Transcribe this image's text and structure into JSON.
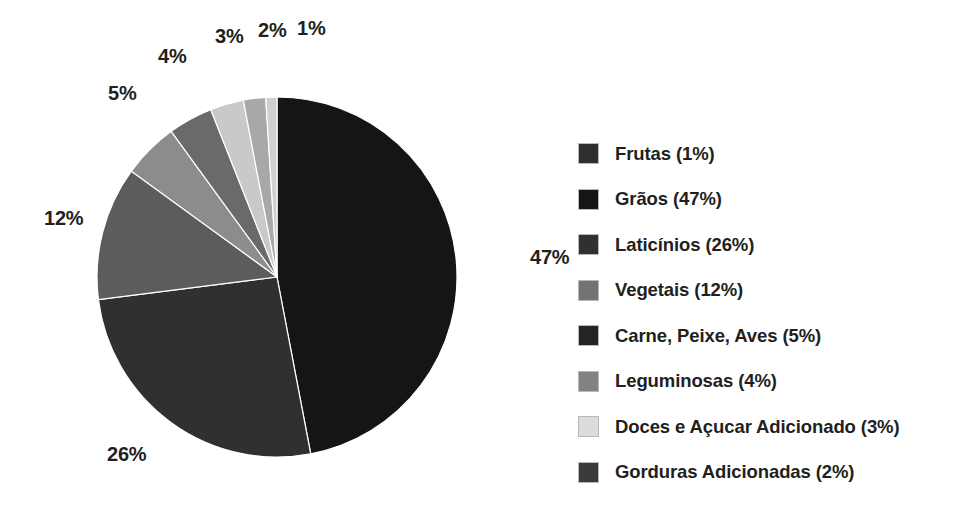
{
  "chart_data": {
    "type": "pie",
    "title": "",
    "subtitle": "",
    "xlabel": "",
    "ylabel": "",
    "units": "percent",
    "legend_position": "right",
    "grid": false,
    "start_angle_deg": 0,
    "direction": "clockwise",
    "categories": [
      "Frutas",
      "Grãos",
      "Laticínios",
      "Vegetais",
      "Carne, Peixe, Aves",
      "Leguminosas",
      "Doces e Açucar Adicionado",
      "Gorduras Adicionadas"
    ],
    "values": [
      1,
      47,
      26,
      12,
      5,
      4,
      3,
      2
    ],
    "colors": [
      "#2f2f2f",
      "#151515",
      "#303030",
      "#737373",
      "#242424",
      "#828282",
      "#dcdcdc",
      "#3a3a3a"
    ],
    "slice_order_clockwise_from_top": [
      "Grãos",
      "Laticínios",
      "Vegetais",
      "Carne, Peixe, Aves",
      "Leguminosas",
      "Doces e Açucar Adicionado",
      "Gorduras Adicionadas",
      "Frutas"
    ]
  },
  "pie": {
    "geometry": {
      "cx": 277,
      "cy": 277,
      "r": 180
    },
    "slices": [
      {
        "name": "graos",
        "label": "Grãos",
        "percent": 47,
        "color": "#151515",
        "start_deg": 0,
        "sweep_deg": 169.2
      },
      {
        "name": "laticinios",
        "label": "Laticínios",
        "percent": 26,
        "color": "#303030",
        "start_deg": 169.2,
        "sweep_deg": 93.6
      },
      {
        "name": "vegetais",
        "label": "Vegetais",
        "percent": 12,
        "color": "#5c5c5c",
        "start_deg": 262.8,
        "sweep_deg": 43.2
      },
      {
        "name": "carne-peixe-aves",
        "label": "Carne, Peixe, Aves",
        "percent": 5,
        "color": "#8c8c8c",
        "start_deg": 306.0,
        "sweep_deg": 18.0
      },
      {
        "name": "leguminosas",
        "label": "Leguminosas",
        "percent": 4,
        "color": "#6a6a6a",
        "start_deg": 324.0,
        "sweep_deg": 14.4
      },
      {
        "name": "doces-acucar-adicionado",
        "label": "Doces e Açucar Adicionado",
        "percent": 3,
        "color": "#c9c9c9",
        "start_deg": 338.4,
        "sweep_deg": 10.8
      },
      {
        "name": "gorduras-adicionadas",
        "label": "Gorduras Adicionadas",
        "percent": 2,
        "color": "#a8a8a8",
        "start_deg": 349.2,
        "sweep_deg": 7.2
      },
      {
        "name": "frutas",
        "label": "Frutas",
        "percent": 1,
        "color": "#d0d0d0",
        "start_deg": 356.4,
        "sweep_deg": 3.6
      }
    ],
    "value_labels": [
      {
        "name": "value-label-47",
        "text": "47%",
        "x": 530,
        "y": 247
      },
      {
        "name": "value-label-26",
        "text": "26%",
        "x": 107,
        "y": 444
      },
      {
        "name": "value-label-12",
        "text": "12%",
        "x": 44,
        "y": 208
      },
      {
        "name": "value-label-5",
        "text": "5%",
        "x": 108,
        "y": 83
      },
      {
        "name": "value-label-4",
        "text": "4%",
        "x": 158,
        "y": 46
      },
      {
        "name": "value-label-3",
        "text": "3%",
        "x": 215,
        "y": 26
      },
      {
        "name": "value-label-2",
        "text": "2%",
        "x": 258,
        "y": 20
      },
      {
        "name": "value-label-1",
        "text": "1%",
        "x": 297,
        "y": 18
      }
    ]
  },
  "legend": {
    "items": [
      {
        "name": "frutas",
        "label": "Frutas (1%)",
        "color": "#2f2f2f"
      },
      {
        "name": "graos",
        "label": "Grãos (47%)",
        "color": "#151515"
      },
      {
        "name": "laticinios",
        "label": "Laticínios (26%)",
        "color": "#303030"
      },
      {
        "name": "vegetais",
        "label": "Vegetais  (12%)",
        "color": "#737373"
      },
      {
        "name": "carne-peixe-aves",
        "label": "Carne, Peixe, Aves (5%)",
        "color": "#242424"
      },
      {
        "name": "leguminosas",
        "label": "Leguminosas (4%)",
        "color": "#828282"
      },
      {
        "name": "doces-acucar-adicionado",
        "label": "Doces e Açucar Adicionado (3%)",
        "color": "#dcdcdc"
      },
      {
        "name": "gorduras-adicionadas",
        "label": "Gorduras Adicionadas (2%)",
        "color": "#3a3a3a"
      }
    ]
  }
}
